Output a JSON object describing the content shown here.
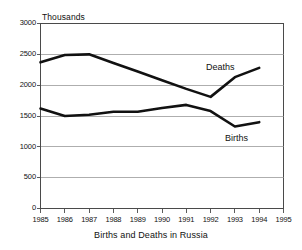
{
  "chart_data": {
    "type": "line",
    "title": "Births and Deaths in Russia",
    "unit_label": "Thousands",
    "xlabel": "",
    "ylabel": "Thousands",
    "grid": true,
    "legend_position": "inline-annotations",
    "xlim": [
      1985,
      1995
    ],
    "ylim": [
      0,
      3000
    ],
    "xticks": [
      "1985",
      "1986",
      "1987",
      "1988",
      "1989",
      "1990",
      "1991",
      "1992",
      "1993",
      "1994",
      "1995"
    ],
    "yticks": [
      "0",
      "500",
      "1000",
      "1500",
      "2000",
      "2500",
      "3000"
    ],
    "x": [
      1985,
      1986,
      1987,
      1988,
      1989,
      1990,
      1991,
      1992,
      1993,
      1994
    ],
    "series": [
      {
        "name": "Deaths",
        "color": "#111111",
        "values": [
          2370,
          2490,
          2500,
          2360,
          2220,
          2080,
          1940,
          1810,
          2130,
          2280
        ]
      },
      {
        "name": "Births",
        "color": "#111111",
        "values": [
          1620,
          1500,
          1520,
          1570,
          1570,
          1630,
          1680,
          1580,
          1330,
          1400
        ]
      }
    ],
    "annotations": [
      {
        "text": "Deaths",
        "x": 1992.0,
        "y": 2320
      },
      {
        "text": "Births",
        "x": 1992.8,
        "y": 1180
      }
    ]
  },
  "axis": {
    "y_unit_caption": "Thousands"
  },
  "colors": {
    "line": "#111111",
    "grid": "#8c8c8c",
    "frame": "#4a4a4a",
    "background": "#ffffff",
    "text": "#111111"
  }
}
